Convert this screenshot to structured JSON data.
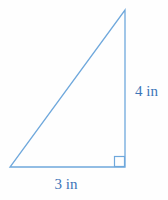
{
  "figure": {
    "shape": "right triangle",
    "stroke_color": "#6fa8dc",
    "label_color": "#3d74b8",
    "background_color": "#fefefe",
    "labels": {
      "vertical_side": "4 in",
      "horizontal_side": "3 in"
    },
    "values": {
      "height_in": 4,
      "base_in": 3
    }
  }
}
